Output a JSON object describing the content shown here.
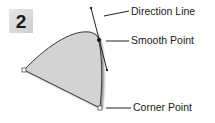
{
  "step_badge": {
    "number": "2"
  },
  "labels": {
    "direction_line": "Direction Line",
    "smooth_point": "Smooth Point",
    "corner_point": "Corner Point"
  },
  "colors": {
    "shape_fill": "#d3d3d3",
    "stroke": "#333333",
    "badge_bg": "#d9d9d9",
    "text": "#1c1c1c"
  }
}
